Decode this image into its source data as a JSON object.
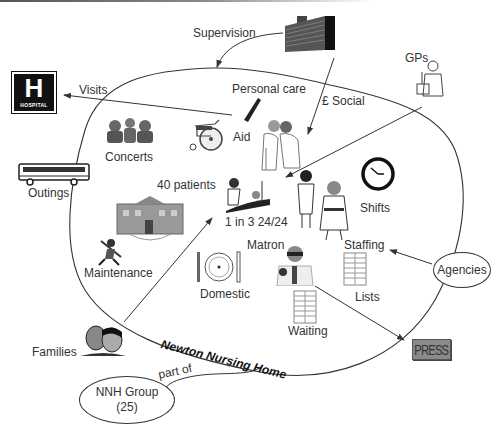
{
  "diagram": {
    "type": "rich picture",
    "title": "Newton Nursing Home",
    "colors": {
      "line": "#333333",
      "text": "#333333",
      "background": "#ffffff",
      "press_box": "#8a8a8a"
    },
    "inside_labels": {
      "personal_care": "Personal care",
      "aid": "Aid",
      "concerts": "Concerts",
      "patients": "40 patients",
      "ratio": "1 in 3 24/24",
      "shifts": "Shifts",
      "maintenance": "Maintenance",
      "domestic": "Domestic",
      "matron": "Matron",
      "staffing": "Staffing",
      "lists": "Lists",
      "waiting": "Waiting"
    },
    "outside_labels": {
      "supervision": "Supervision",
      "social": "£ Social",
      "gps": "GPs",
      "visits": "Visits",
      "outings": "Outings",
      "families": "Families",
      "part_of": "part of"
    },
    "external_entities": {
      "agencies": "Agencies",
      "group_name": "NNH Group",
      "group_count": "(25)",
      "hospital_sign_letter": "H",
      "hospital_sign_text": "HOSPITAL",
      "press_sign_text": "PRESS"
    },
    "icons": [
      "hospital-sign-icon",
      "office-building-icon",
      "gp-doctor-icon",
      "comb-icon",
      "wheelchair-icon",
      "carers-icon",
      "choir-icon",
      "bus-icon",
      "patient-bed-icon",
      "clock-icon",
      "nurses-icon",
      "house-icon",
      "handyman-icon",
      "plate-cutlery-icon",
      "matron-icon",
      "list-table-icon",
      "families-faces-icon",
      "press-icon"
    ],
    "connections": [
      {
        "from": "Supervision (office building)",
        "to": "Newton Nursing Home",
        "label": "Supervision"
      },
      {
        "from": "office building",
        "to": "Aid",
        "label": "£ Social"
      },
      {
        "from": "GPs",
        "to": "1 in 3 24/24"
      },
      {
        "from": "Aid",
        "to": "Hospital",
        "label": "Visits"
      },
      {
        "from": "Families",
        "to": "40 patients"
      },
      {
        "from": "Agencies",
        "to": "Staffing"
      },
      {
        "from": "Matron",
        "to": "Press"
      },
      {
        "from": "Newton Nursing Home",
        "to": "NNH Group (25)",
        "label": "part of"
      }
    ]
  }
}
